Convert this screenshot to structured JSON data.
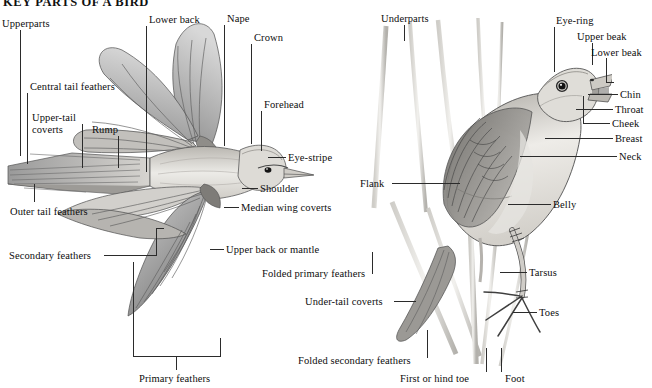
{
  "page": {
    "title": "KEY PARTS OF A BIRD",
    "background": "#ffffff",
    "ink": "#2b2b2b",
    "width": 652,
    "height": 388
  },
  "figures": [
    {
      "name": "flying-bird",
      "caption_group": "left",
      "description": "Dorsal view of a bird in flight with wings spread and tail fanned"
    },
    {
      "name": "perched-bird",
      "caption_group": "right",
      "description": "Side view of a bird perched on reed stems with beak open"
    }
  ],
  "labels_left": [
    {
      "id": "upperparts",
      "text": "Upperparts",
      "x": 2,
      "y": 18
    },
    {
      "id": "lower-back",
      "text": "Lower back",
      "x": 149,
      "y": 14
    },
    {
      "id": "nape",
      "text": "Nape",
      "x": 227,
      "y": 13
    },
    {
      "id": "crown",
      "text": "Crown",
      "x": 254,
      "y": 32
    },
    {
      "id": "central-tail-feathers",
      "text": "Central tail feathers",
      "x": 30,
      "y": 81
    },
    {
      "id": "forehead",
      "text": "Forehead",
      "x": 264,
      "y": 99
    },
    {
      "id": "upper-tail-coverts",
      "text": "Upper-tail coverts",
      "x": 32,
      "y": 112
    },
    {
      "id": "rump",
      "text": "Rump",
      "x": 92,
      "y": 124
    },
    {
      "id": "eye-stripe",
      "text": "Eye-stripe",
      "x": 288,
      "y": 152
    },
    {
      "id": "shoulder",
      "text": "Shoulder",
      "x": 260,
      "y": 183
    },
    {
      "id": "outer-tail-feathers",
      "text": "Outer tail feathers",
      "x": 10,
      "y": 206
    },
    {
      "id": "median-wing-coverts",
      "text": "Median wing coverts",
      "x": 241,
      "y": 202
    },
    {
      "id": "secondary-feathers",
      "text": "Secondary feathers",
      "x": 9,
      "y": 250
    },
    {
      "id": "upper-back-or-mantle",
      "text": "Upper back or mantle",
      "x": 226,
      "y": 244
    },
    {
      "id": "primary-feathers",
      "text": "Primary feathers",
      "x": 139,
      "y": 373
    }
  ],
  "labels_right": [
    {
      "id": "underparts",
      "text": "Underparts",
      "x": 381,
      "y": 13
    },
    {
      "id": "eye-ring",
      "text": "Eye-ring",
      "x": 556,
      "y": 15
    },
    {
      "id": "upper-beak",
      "text": "Upper beak",
      "x": 577,
      "y": 31
    },
    {
      "id": "lower-beak",
      "text": "Lower beak",
      "x": 591,
      "y": 47
    },
    {
      "id": "chin",
      "text": "Chin",
      "x": 620,
      "y": 89
    },
    {
      "id": "throat",
      "text": "Throat",
      "x": 615,
      "y": 104
    },
    {
      "id": "cheek",
      "text": "Cheek",
      "x": 612,
      "y": 118
    },
    {
      "id": "breast",
      "text": "Breast",
      "x": 615,
      "y": 133
    },
    {
      "id": "neck",
      "text": "Neck",
      "x": 619,
      "y": 151
    },
    {
      "id": "flank",
      "text": "Flank",
      "x": 360,
      "y": 178
    },
    {
      "id": "belly",
      "text": "Belly",
      "x": 553,
      "y": 199
    },
    {
      "id": "folded-primary-feathers",
      "text": "Folded primary feathers",
      "x": 262,
      "y": 268
    },
    {
      "id": "tarsus",
      "text": "Tarsus",
      "x": 529,
      "y": 267
    },
    {
      "id": "under-tail-coverts",
      "text": "Under-tail coverts",
      "x": 305,
      "y": 296
    },
    {
      "id": "toes",
      "text": "Toes",
      "x": 539,
      "y": 307
    },
    {
      "id": "folded-secondary-feathers",
      "text": "Folded secondary feathers",
      "x": 298,
      "y": 355
    },
    {
      "id": "first-or-hind-toe",
      "text": "First or hind toe",
      "x": 400,
      "y": 373
    },
    {
      "id": "foot",
      "text": "Foot",
      "x": 505,
      "y": 373
    }
  ]
}
